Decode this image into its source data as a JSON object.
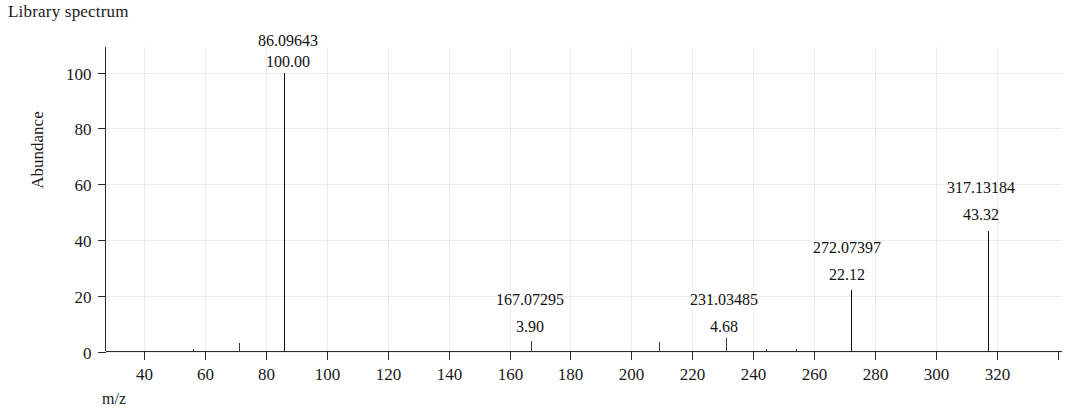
{
  "title": "Library spectrum",
  "axes": {
    "y_title": "Abundance",
    "x_title": "m/z",
    "y_ticks": [
      "0",
      "20",
      "40",
      "60",
      "80",
      "100"
    ],
    "x_ticks": [
      "40",
      "60",
      "80",
      "100",
      "120",
      "140",
      "160",
      "180",
      "200",
      "220",
      "240",
      "260",
      "280",
      "300",
      "320"
    ]
  },
  "labels": {
    "p1_mz": "86.09643",
    "p1_ab": "100.00",
    "p2_mz": "167.07295",
    "p2_ab": "3.90",
    "p3_mz": "231.03485",
    "p3_ab": "4.68",
    "p4_mz": "272.07397",
    "p4_ab": "22.12",
    "p5_mz": "317.13184",
    "p5_ab": "43.32"
  },
  "colors": {
    "peak": "#111111",
    "axis": "#2a2a2a",
    "grid": "#ededee",
    "text": "#1a1a1a",
    "background": "#ffffff"
  },
  "chart_data": {
    "type": "bar",
    "title": "Library spectrum",
    "xlabel": "m/z",
    "ylabel": "Abundance",
    "xlim": [
      28,
      340
    ],
    "ylim": [
      0,
      108
    ],
    "grid": true,
    "legend": null,
    "x": [
      56.05,
      71.07,
      86.09643,
      167.07295,
      209.04,
      231.03485,
      244.05,
      254.06,
      272.07397,
      317.13184
    ],
    "values": [
      0.9,
      3.1,
      100.0,
      3.9,
      3.4,
      4.68,
      0.8,
      0.9,
      22.12,
      43.32
    ],
    "labeled_peaks": [
      {
        "mz": "86.09643",
        "abundance": "100.00",
        "mz_value": 86.09643,
        "value": 100.0
      },
      {
        "mz": "167.07295",
        "abundance": "3.90",
        "mz_value": 167.07295,
        "value": 3.9
      },
      {
        "mz": "231.03485",
        "abundance": "4.68",
        "mz_value": 231.03485,
        "value": 4.68
      },
      {
        "mz": "272.07397",
        "abundance": "22.12",
        "mz_value": 272.07397,
        "value": 22.12
      },
      {
        "mz": "317.13184",
        "abundance": "43.32",
        "mz_value": 317.13184,
        "value": 43.32
      }
    ],
    "unlabeled_peaks": [
      {
        "mz_value": 56.05,
        "value": 0.9
      },
      {
        "mz_value": 71.07,
        "value": 3.1
      },
      {
        "mz_value": 209.04,
        "value": 3.4
      },
      {
        "mz_value": 244.05,
        "value": 0.8
      },
      {
        "mz_value": 254.06,
        "value": 0.9
      }
    ]
  }
}
